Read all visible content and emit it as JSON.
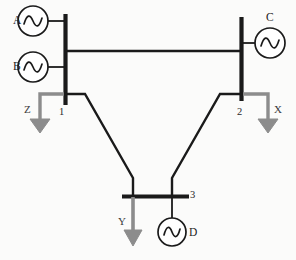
{
  "diagram": {
    "colors": {
      "line": "#1a1a1a",
      "load": "#8c8c8c",
      "background": "#fbfbfa",
      "text": "#1c1c1c"
    },
    "generators": [
      {
        "id": "gen-a",
        "label": "A",
        "bus": "1",
        "cx": 33,
        "cy": 21,
        "r": 15,
        "label_x": 13,
        "label_y": 15
      },
      {
        "id": "gen-b",
        "label": "B",
        "bus": "1",
        "cx": 33,
        "cy": 67,
        "r": 15,
        "label_x": 13,
        "label_y": 61
      },
      {
        "id": "gen-c",
        "label": "C",
        "bus": "2",
        "cx": 270,
        "cy": 43,
        "r": 15,
        "label_x": 266,
        "label_y": 12
      },
      {
        "id": "gen-d",
        "label": "D",
        "bus": "3",
        "cx": 172,
        "cy": 232,
        "r": 14,
        "label_x": 189,
        "label_y": 227
      }
    ],
    "buses": [
      {
        "id": "bus-1",
        "label": "1",
        "orientation": "vertical",
        "label_x": 59,
        "label_y": 107
      },
      {
        "id": "bus-2",
        "label": "2",
        "orientation": "vertical",
        "label_x": 237,
        "label_y": 107
      },
      {
        "id": "bus-3",
        "label": "3",
        "orientation": "horizontal",
        "label_x": 190,
        "label_y": 190
      }
    ],
    "loads": [
      {
        "id": "load-z",
        "label": "Z",
        "bus": "1",
        "direction": "down",
        "label_x": 24,
        "label_y": 104
      },
      {
        "id": "load-x",
        "label": "X",
        "bus": "2",
        "direction": "down",
        "label_x": 274,
        "label_y": 104
      },
      {
        "id": "load-y",
        "label": "Y",
        "bus": "3",
        "direction": "down",
        "label_x": 118,
        "label_y": 216
      }
    ],
    "lines": [
      {
        "id": "tie-line-1-2",
        "from": "1",
        "to": "2"
      },
      {
        "id": "line-1-3",
        "from": "1",
        "to": "3"
      },
      {
        "id": "line-2-3",
        "from": "2",
        "to": "3"
      }
    ]
  }
}
